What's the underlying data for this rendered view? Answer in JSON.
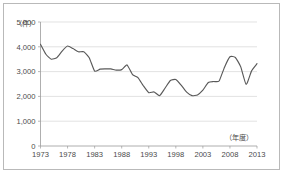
{
  "chart_data": {
    "type": "line",
    "title": "",
    "subtitle": "",
    "xlabel": "（年度）",
    "ylabel": "（件）",
    "ylim": [
      0,
      5000
    ],
    "xlim": [
      1973,
      2013
    ],
    "grid": true,
    "legend": false,
    "y_ticks": [
      "0",
      "1,000",
      "2,000",
      "3,000",
      "4,000",
      "5,000"
    ],
    "y_tick_values": [
      0,
      1000,
      2000,
      3000,
      4000,
      5000
    ],
    "x_ticks": [
      "1973",
      "1978",
      "1983",
      "1988",
      "1993",
      "1998",
      "2003",
      "2008",
      "2013"
    ],
    "x_tick_values": [
      1973,
      1978,
      1983,
      1988,
      1993,
      1998,
      2003,
      2008,
      2013
    ],
    "line_color": "#595959",
    "x": [
      1973,
      1974,
      1975,
      1976,
      1977,
      1978,
      1979,
      1980,
      1981,
      1982,
      1983,
      1984,
      1985,
      1986,
      1987,
      1988,
      1989,
      1990,
      1991,
      1992,
      1993,
      1994,
      1995,
      1996,
      1997,
      1998,
      1999,
      2000,
      2001,
      2002,
      2003,
      2004,
      2005,
      2006,
      2007,
      2008,
      2009,
      2010,
      2011,
      2012,
      2013
    ],
    "values": [
      4100,
      3700,
      3500,
      3560,
      3830,
      4030,
      3930,
      3800,
      3800,
      3560,
      3020,
      3100,
      3110,
      3110,
      3060,
      3080,
      3270,
      2880,
      2760,
      2430,
      2150,
      2180,
      2030,
      2330,
      2640,
      2680,
      2450,
      2170,
      2030,
      2060,
      2250,
      2560,
      2600,
      2620,
      3180,
      3600,
      3570,
      3190,
      2480,
      3030,
      3320
    ],
    "series": [
      {
        "name": "件数",
        "values": [
          4100,
          3700,
          3500,
          3560,
          3830,
          4030,
          3930,
          3800,
          3800,
          3560,
          3020,
          3100,
          3110,
          3110,
          3060,
          3080,
          3270,
          2880,
          2760,
          2430,
          2150,
          2180,
          2030,
          2330,
          2640,
          2680,
          2450,
          2170,
          2030,
          2060,
          2250,
          2560,
          2600,
          2620,
          3180,
          3600,
          3570,
          3190,
          2480,
          3030,
          3320
        ]
      }
    ]
  }
}
